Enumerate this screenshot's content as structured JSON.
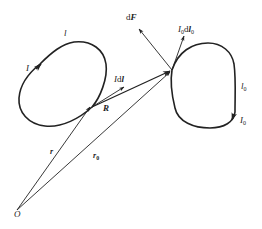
{
  "diagram": {
    "type": "physics-vector-diagram",
    "top_cutoff_text": "",
    "colors": {
      "stroke": "#222222",
      "background": "#ffffff"
    },
    "loops": [
      {
        "id": "loop-l",
        "path_label": "l",
        "current_label": "I"
      },
      {
        "id": "loop-l0",
        "path_label": "l",
        "path_sub": "0",
        "current_label": "I",
        "current_sub": "0"
      }
    ],
    "vectors": {
      "force": {
        "prefix": "d",
        "symbol": "F"
      },
      "element": {
        "prefix": "I",
        "mid": "d",
        "symbol": "l"
      },
      "element0": {
        "prefix": "I",
        "prefix_sub": "0",
        "mid": "d",
        "symbol": "l",
        "symbol_sub": "0"
      },
      "separation": {
        "symbol": "R"
      },
      "position": {
        "symbol": "r"
      },
      "position0": {
        "symbol": "r",
        "sub": "0"
      }
    },
    "origin": {
      "label": "O"
    }
  }
}
